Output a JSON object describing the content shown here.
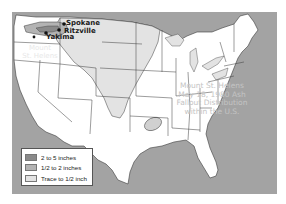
{
  "map": {
    "title_lines": [
      "Mount St. Helens",
      "May 18, 1980 Ash",
      "Fallout Distribution",
      "within the U.S."
    ],
    "volcano_label_lines": [
      "Mount",
      "St. Helens"
    ],
    "cities": [
      {
        "name": "Spokane"
      },
      {
        "name": "Ritzville"
      },
      {
        "name": "Yakima"
      }
    ],
    "colors": {
      "ocean": "#a3a3a3",
      "land": "#ffffff",
      "heavy": "#8a8a8a",
      "medium": "#b3b3b3",
      "trace": "#e3e3e3",
      "border": "#3a3a3a"
    }
  },
  "legend": {
    "items": [
      {
        "label": "2 to 5 inches",
        "color": "#8a8a8a"
      },
      {
        "label": "1/2 to 2 inches",
        "color": "#b3b3b3"
      },
      {
        "label": "Trace to 1/2 inch",
        "color": "#e3e3e3"
      }
    ]
  }
}
